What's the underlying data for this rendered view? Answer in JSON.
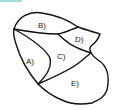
{
  "header": {
    "cut_title_color": "#5cc8c0"
  },
  "diagram": {
    "regions": [
      {
        "id": "A",
        "label": "A)"
      },
      {
        "id": "B",
        "label": "B)"
      },
      {
        "id": "C",
        "label": "C)"
      },
      {
        "id": "D",
        "label": "D)"
      },
      {
        "id": "E",
        "label": "E)"
      }
    ],
    "stroke_color": "#111111"
  }
}
